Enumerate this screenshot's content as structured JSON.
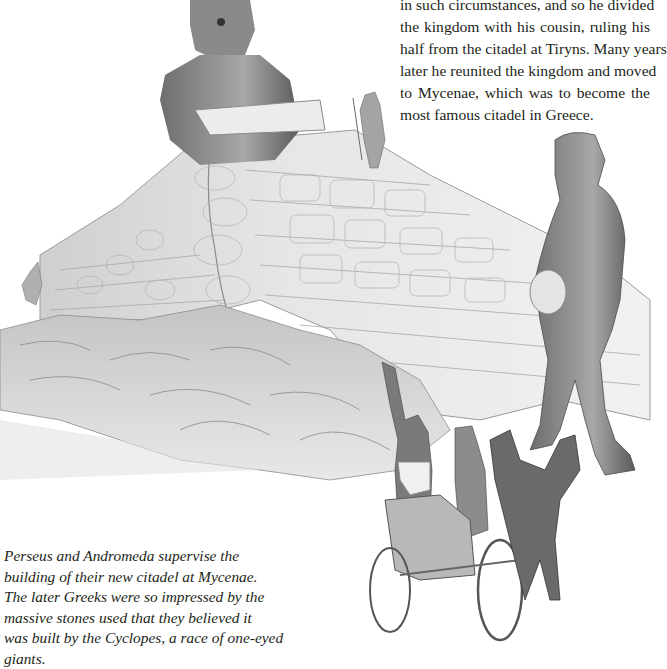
{
  "page": {
    "body_text_lines": [
      "in such circumstances, and so he divided",
      "the kingdom with his cousin, ruling his",
      "half from the citadel at Tiryns. Many years",
      "later he reunited the kingdom and moved",
      "to Mycenae, which was to become the",
      "most famous citadel in Greece."
    ],
    "caption_lines": [
      "Perseus and Andromeda supervise the",
      "building of their new citadel at Mycenae.",
      "The later Greeks were so impressed by the",
      "massive stones used that they believed it",
      "was built by the Cyclopes, a race of one-eyed",
      "giants."
    ],
    "illustration": {
      "subject": "Cyclopes building the stone walls of Mycenae while Perseus and Andromeda watch from a chariot",
      "style": "grayscale pencil drawing",
      "elements": [
        "cyclops-lifting-stone",
        "worker-on-wall",
        "stone-wall",
        "rocky-outcrop",
        "cyclops-carrying-boulder",
        "perseus",
        "andromeda",
        "chariot",
        "horses"
      ]
    },
    "colors": {
      "text": "#231f20",
      "background": "#ffffff",
      "drawing_dark": "#555555",
      "drawing_mid": "#9a9a9a",
      "drawing_light": "#d8d8d8"
    }
  }
}
